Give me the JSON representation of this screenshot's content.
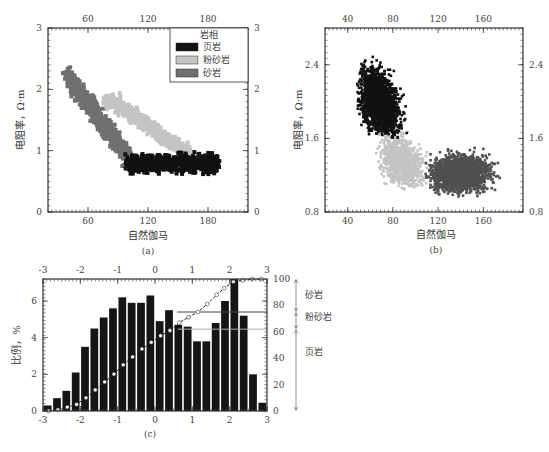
{
  "chart_data": [
    {
      "id": "a",
      "type": "scatter",
      "caption": "(a)",
      "xlabel": "自然伽马",
      "ylabel": "电阻率，Ω·m",
      "xlim": [
        20,
        220
      ],
      "ylim": [
        0,
        3
      ],
      "xticks": [
        60,
        120,
        180
      ],
      "yticks": [
        0,
        1,
        2,
        3
      ],
      "legend": {
        "title": "岩相",
        "position": "upper right",
        "entries": [
          {
            "label": "页岩",
            "color": "#111111"
          },
          {
            "label": "粉砂岩",
            "color": "#c4c4c4"
          },
          {
            "label": "砂岩",
            "color": "#707070"
          }
        ]
      },
      "series": [
        {
          "name": "砂岩",
          "color": "#707070",
          "x_range": [
            35,
            100
          ],
          "y_range": [
            0.7,
            2.5
          ]
        },
        {
          "name": "粉砂岩",
          "color": "#c4c4c4",
          "x_range": [
            78,
            170
          ],
          "y_range": [
            0.9,
            2.0
          ]
        },
        {
          "name": "页岩",
          "color": "#111111",
          "x_range": [
            85,
            205
          ],
          "y_range": [
            0.4,
            1.05
          ]
        }
      ]
    },
    {
      "id": "b",
      "type": "scatter",
      "caption": "(b)",
      "xlabel": "自然伽马",
      "ylabel": "电阻率，Ω·m",
      "xlim": [
        20,
        195
      ],
      "ylim": [
        0.8,
        2.8
      ],
      "xticks": [
        40,
        80,
        120,
        160
      ],
      "yticks": [
        0.8,
        1.6,
        2.4
      ],
      "series": [
        {
          "name": "页岩",
          "color": "#111111",
          "x_range": [
            48,
            105
          ],
          "y_range": [
            1.6,
            2.7
          ]
        },
        {
          "name": "粉砂岩",
          "color": "#c4c4c4",
          "x_range": [
            58,
            130
          ],
          "y_range": [
            1.05,
            2.0
          ]
        },
        {
          "name": "砂岩",
          "color": "#505050",
          "x_range": [
            105,
            182
          ],
          "y_range": [
            0.95,
            1.6
          ]
        }
      ]
    },
    {
      "id": "c",
      "type": "bar",
      "caption": "(c)",
      "xlabel": "",
      "ylabel": "比例，%",
      "xlim": [
        -3,
        3
      ],
      "ylim": [
        0,
        7.2
      ],
      "xticks": [
        -3,
        -2,
        -1,
        0,
        1,
        2,
        3
      ],
      "yticks": [
        0,
        2,
        4,
        6
      ],
      "y2lim": [
        0,
        100
      ],
      "y2ticks": [
        0,
        20,
        40,
        60,
        80,
        100
      ],
      "bar_width": 0.25,
      "x": [
        -2.875,
        -2.625,
        -2.375,
        -2.125,
        -1.875,
        -1.625,
        -1.375,
        -1.125,
        -0.875,
        -0.625,
        -0.375,
        -0.125,
        0.125,
        0.375,
        0.625,
        0.875,
        1.125,
        1.375,
        1.625,
        1.875,
        2.125,
        2.375,
        2.625,
        2.875
      ],
      "values": [
        0.3,
        0.7,
        1.1,
        2.1,
        3.5,
        4.5,
        5.1,
        5.6,
        6.2,
        5.9,
        5.9,
        6.3,
        4.9,
        5.5,
        4.7,
        4.6,
        3.8,
        3.8,
        4.8,
        6.0,
        7.2,
        5.2,
        2.0,
        0.45
      ],
      "cumulative_series": {
        "name": "累计比例",
        "axis": "right",
        "x": [
          -2.85,
          -2.6,
          -2.35,
          -2.1,
          -1.85,
          -1.6,
          -1.35,
          -1.1,
          -0.85,
          -0.6,
          -0.35,
          -0.1,
          0.15,
          0.4,
          0.65,
          0.9,
          1.15,
          1.4,
          1.65,
          1.85,
          2.1,
          2.35,
          2.6,
          2.85
        ],
        "values": [
          0,
          1,
          3,
          5,
          10,
          16,
          22,
          28,
          35,
          41,
          47,
          52,
          57,
          61,
          67,
          71,
          75,
          81,
          88,
          93,
          98,
          99,
          100,
          100
        ]
      },
      "thresholds": [
        {
          "value": 62,
          "color": "#aaaaaa",
          "label": "页岩/粉砂岩"
        },
        {
          "value": 75,
          "color": "#444444",
          "label": "粉砂岩/砂岩"
        }
      ],
      "facies_annotations": [
        {
          "label": "砂岩",
          "range": [
            75,
            100
          ]
        },
        {
          "label": "粉砂岩",
          "range": [
            62,
            75
          ]
        },
        {
          "label": "页岩",
          "range": [
            0,
            62
          ]
        }
      ]
    }
  ],
  "labels": {
    "a_caption": "(a)",
    "b_caption": "(b)",
    "c_caption": "(c)",
    "xlabel": "自然伽马",
    "ylabel_res": "电阻率，Ω·m",
    "ylabel_pct": "比例，%",
    "legend_title": "岩相",
    "legend_shale": "页岩",
    "legend_siltstone": "粉砂岩",
    "legend_sandstone": "砂岩",
    "ann_sand": "砂岩",
    "ann_silt": "粉砂岩",
    "ann_shale": "页岩"
  }
}
